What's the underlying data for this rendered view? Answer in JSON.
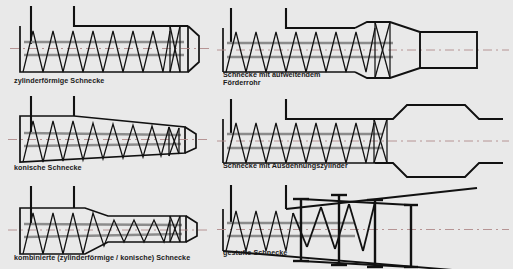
{
  "figure": {
    "background_color": "#e9e9e9",
    "outline_color": "#111111",
    "shaft_color": "#8c8c8c",
    "centerline_color": "#b08a8a",
    "label_color": "#1a1a1a"
  },
  "panels": [
    {
      "id": "zylinderfoermige-schnecke",
      "label": "zylinderförmige Schnecke",
      "column": "left",
      "row": 1,
      "barrel_type": "cylindrical",
      "flight_count": 6,
      "has_nose_cone": true,
      "hopper_walls": 2
    },
    {
      "id": "konische-schnecke",
      "label": "konische Schnecke",
      "column": "left",
      "row": 2,
      "barrel_type": "conical",
      "flight_count": 6,
      "has_nose_cone": true,
      "hopper_walls": 2
    },
    {
      "id": "kombinierte-schnecke",
      "label": "kombinierte (zylinderförmige / konische) Schnecke",
      "column": "left",
      "row": 3,
      "barrel_type": "cylindrical-then-conical",
      "flight_count": 6,
      "has_nose_cone": true,
      "hopper_walls": 2
    },
    {
      "id": "schnecke-mit-aufweitendem-foerderrohr",
      "label_line1": "Schnecke mit aufweitendem",
      "label_line2": "Förderrohr",
      "column": "right",
      "row": 1,
      "barrel_type": "expanding-conveyor-tube",
      "flight_count": 5,
      "has_nose_cone": false,
      "hopper_walls": 2
    },
    {
      "id": "schnecke-mit-ausdehnungszylinder",
      "label": "Schnecke mit Ausdehnungszylinder",
      "column": "right",
      "row": 2,
      "barrel_type": "expansion-cylinder",
      "flight_count": 5,
      "has_nose_cone": false,
      "hopper_walls": 2
    },
    {
      "id": "gestufte-schnecke",
      "label": "gestufte Schnecke",
      "column": "right",
      "row": 3,
      "barrel_type": "stepped-with-paddles",
      "flight_count": 3,
      "paddle_count": 4,
      "has_nose_cone": false,
      "hopper_walls": 2
    }
  ]
}
